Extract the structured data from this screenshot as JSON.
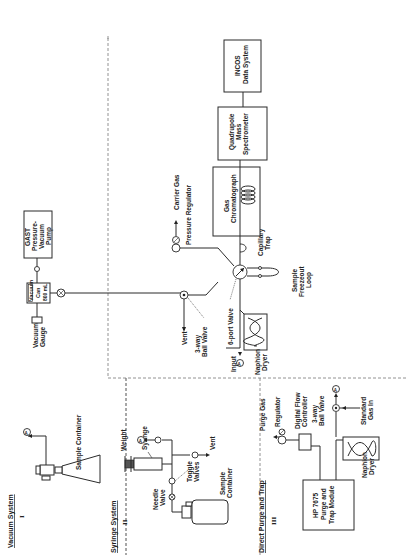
{
  "diagram": {
    "orientation": "rotated-90-ccw",
    "sections": [
      {
        "id": "I",
        "title": "Vacuum System",
        "numeral": "I"
      },
      {
        "id": "II",
        "title": "Syringe System",
        "numeral": "II"
      },
      {
        "id": "III",
        "title": "Direct Purge and Trap",
        "numeral": "III"
      }
    ],
    "vacuum_system": {
      "sample_container": "Sample Container",
      "connector": "A",
      "vacuum_gauge": [
        "Vacuum",
        "Gauge"
      ],
      "vacuum_can": [
        "Vacuum",
        "Can",
        "800 mL"
      ],
      "pump": [
        "GAST",
        "Pressure-",
        "Vacuum",
        "Pump"
      ]
    },
    "main_system": {
      "vent": "Vent",
      "ball_valve": [
        "3-way",
        "Ball Valve"
      ],
      "six_port_valve": "6-port Valve",
      "input": "Input",
      "input_connector": "A",
      "nafion_dryer": [
        "Naphion",
        "Dryer"
      ],
      "carrier_gas": "Carrier Gas",
      "pressure_regulator": "Pressure Regulator",
      "capillary_trap": [
        "Capillary",
        "Trap"
      ],
      "freezeout_loop": [
        "Sample",
        "Freezeout",
        "Loop"
      ],
      "gc": [
        "Gas",
        "Chromatograph"
      ],
      "ms": [
        "Quadrupole",
        "Mass",
        "Spectrometer"
      ],
      "data_system": [
        "INCOS",
        "Data System"
      ]
    },
    "syringe_system": {
      "weight": "Weight",
      "syringe": "Syringe",
      "connector": "A",
      "needle_valve": [
        "Needle",
        "Valve"
      ],
      "toggle_valves": [
        "Toggle",
        "Valves"
      ],
      "vent": "Vent",
      "sample_container": [
        "Sample",
        "Container"
      ]
    },
    "purge_trap": {
      "purge_gas": "Purge Gas",
      "regulator": "Regulator",
      "flow_controller": [
        "Digital Flow",
        "Controller"
      ],
      "ball_valve": [
        "3-way",
        "Ball Valve"
      ],
      "connector": "A",
      "standard_gas": [
        "Standard",
        "Gas In"
      ],
      "module": [
        "HP 7675",
        "Purge and",
        "Trap Module"
      ],
      "nafion_dryer": [
        "Naphion",
        "Dryer"
      ]
    }
  }
}
